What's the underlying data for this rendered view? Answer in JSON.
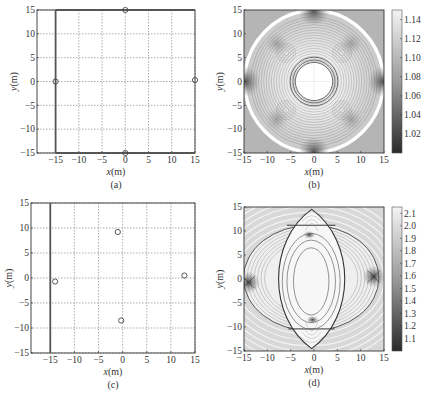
{
  "chart_data": [
    {
      "id": "a",
      "type": "scatter",
      "caption": "(a)",
      "xlabel": "x(m)",
      "ylabel": "y(m)",
      "xlim": [
        -19,
        15
      ],
      "ylim": [
        -15,
        15
      ],
      "xticks": [
        -15,
        -10,
        -5,
        0,
        5,
        10,
        15
      ],
      "yticks": [
        -15,
        -10,
        -5,
        0,
        5,
        10,
        15
      ],
      "grid": true,
      "boundary_lines": [
        {
          "x1": -15,
          "y1": -15,
          "x2": -15,
          "y2": 15
        },
        {
          "x1": -15,
          "y1": 15,
          "x2": 15,
          "y2": 15
        },
        {
          "x1": -15,
          "y1": -15,
          "x2": 15,
          "y2": -15
        }
      ],
      "points": [
        {
          "x": 0,
          "y": 15
        },
        {
          "x": -15,
          "y": 0
        },
        {
          "x": 15,
          "y": 0.3
        },
        {
          "x": 0,
          "y": -15
        }
      ],
      "frame": {
        "left": 37,
        "top": 10,
        "right": 195,
        "bottom": 153
      }
    },
    {
      "id": "b",
      "type": "heatmap",
      "caption": "(b)",
      "xlabel": "x(m)",
      "ylabel": "y(m)",
      "xlim": [
        -15,
        15
      ],
      "ylim": [
        -15,
        15
      ],
      "xticks": [
        -15,
        -10,
        -5,
        0,
        5,
        10,
        15
      ],
      "yticks": [
        -15,
        -10,
        -5,
        0,
        5,
        10,
        15
      ],
      "colorbar": {
        "ticks": [
          1.14,
          1.12,
          1.1,
          1.08,
          1.06,
          1.04,
          1.02
        ],
        "range": [
          1.0,
          1.15
        ]
      },
      "description": "Contour map of GDOP-like ratio for 4 anchors on square; white circular zone centered at origin (r≈4), concentric contours, high-density dark lobes near anchors at (±15,0),(0,±15), white circle arc of radius ≈15",
      "frame": {
        "left": 244,
        "top": 10,
        "right": 384,
        "bottom": 153
      },
      "colorbar_frame": {
        "left": 392,
        "top": 10,
        "right": 402,
        "bottom": 153
      }
    },
    {
      "id": "c",
      "type": "scatter",
      "caption": "(c)",
      "xlabel": "x(m)",
      "ylabel": "y(m)",
      "xlim": [
        -19,
        15
      ],
      "ylim": [
        -15,
        15
      ],
      "xticks": [
        -15,
        -10,
        -5,
        0,
        5,
        10,
        15
      ],
      "yticks": [
        -15,
        -10,
        -5,
        0,
        5,
        10,
        15
      ],
      "grid": true,
      "boundary_lines": [
        {
          "x1": -15,
          "y1": -15,
          "x2": -15,
          "y2": 15
        }
      ],
      "points": [
        {
          "x": -14,
          "y": -0.7
        },
        {
          "x": -1,
          "y": 9.2
        },
        {
          "x": 12.8,
          "y": 0.5
        },
        {
          "x": -0.3,
          "y": -8.5
        }
      ],
      "frame": {
        "left": 31,
        "top": 203,
        "right": 195,
        "bottom": 353
      }
    },
    {
      "id": "d",
      "type": "heatmap",
      "caption": "(d)",
      "xlabel": "x(m)",
      "ylabel": "y(m)",
      "xlim": [
        -15,
        15
      ],
      "ylim": [
        -15,
        15
      ],
      "xticks": [
        -15,
        -10,
        -5,
        0,
        5,
        10,
        15
      ],
      "yticks": [
        -15,
        -10,
        -5,
        0,
        5,
        10,
        15
      ],
      "colorbar": {
        "ticks": [
          2.1,
          2.0,
          1.9,
          1.8,
          1.7,
          1.6,
          1.5,
          1.4,
          1.3,
          1.2,
          1.1
        ],
        "range": [
          1.0,
          2.15
        ]
      },
      "description": "Contour map for irregular anchors; vertical lens-shaped region bounded by dark curves between (−1,9.2) and (−0.3,−8.5), horizontal ellipse-like boundary through anchors (−14,−0.7) and (12.8,0.5); nested elliptical contours at center",
      "frame": {
        "left": 244,
        "top": 207,
        "right": 384,
        "bottom": 351
      },
      "colorbar_frame": {
        "left": 392,
        "top": 207,
        "right": 402,
        "bottom": 351
      }
    }
  ]
}
